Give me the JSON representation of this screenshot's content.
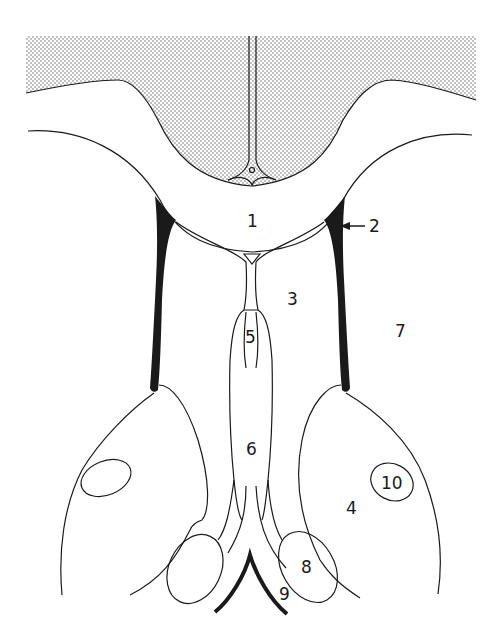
{
  "diagram": {
    "type": "anatomical-cross-section",
    "colors": {
      "line": "#1a1a1a",
      "stipple": "#555555",
      "background": "#ffffff"
    },
    "labels": [
      {
        "id": "1",
        "text": "1",
        "x": 252,
        "y": 221
      },
      {
        "id": "2",
        "text": "2",
        "x": 370,
        "y": 231
      },
      {
        "id": "3",
        "text": "3",
        "x": 292,
        "y": 305
      },
      {
        "id": "4",
        "text": "4",
        "x": 350,
        "y": 512
      },
      {
        "id": "5",
        "text": "5",
        "x": 252,
        "y": 343
      },
      {
        "id": "6",
        "text": "6",
        "x": 252,
        "y": 456
      },
      {
        "id": "7",
        "text": "7",
        "x": 400,
        "y": 336
      },
      {
        "id": "8",
        "text": "8",
        "x": 307,
        "y": 572
      },
      {
        "id": "9",
        "text": "9",
        "x": 286,
        "y": 599
      },
      {
        "id": "10",
        "text": "10",
        "x": 395,
        "y": 487
      }
    ],
    "pointer": {
      "label": "2",
      "from_x": 365,
      "to_x": 340,
      "y": 226
    }
  }
}
